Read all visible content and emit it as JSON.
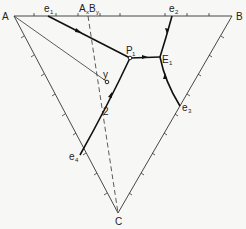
{
  "diagram": {
    "type": "ternary-phase-diagram",
    "vertices": {
      "A": {
        "label": "A",
        "x": 14,
        "y": 16
      },
      "B": {
        "label": "B",
        "x": 232,
        "y": 16
      },
      "C": {
        "label": "C",
        "x": 118,
        "y": 213
      }
    },
    "points": {
      "e1": {
        "label": "e",
        "sub": "1",
        "x": 48,
        "y": 16
      },
      "AxBy": {
        "label": "A",
        "sub1": "x",
        "mid": "B",
        "sub2": "y",
        "x": 88,
        "y": 16
      },
      "e2": {
        "label": "e",
        "sub": "2",
        "x": 172,
        "y": 16
      },
      "P1": {
        "label": "P",
        "sub": "1",
        "x": 130,
        "y": 58
      },
      "E1": {
        "label": "E",
        "sub": "1",
        "x": 160,
        "y": 57
      },
      "e3": {
        "label": "e",
        "sub": "3",
        "x": 180,
        "y": 106
      },
      "e4": {
        "label": "e",
        "sub": "4",
        "x": 80,
        "y": 155
      },
      "y": {
        "label": "y",
        "x": 107,
        "y": 82
      },
      "p2": {
        "label": "2",
        "x": 101,
        "y": 111
      }
    },
    "curves": [
      {
        "name": "e1-P1",
        "from": "e1",
        "to": "P1",
        "arrow": "toward P1",
        "style": "bold"
      },
      {
        "name": "P1-E1",
        "from": "P1",
        "to": "E1",
        "arrow": "toward E1",
        "style": "bold"
      },
      {
        "name": "e2-E1",
        "from": "e2",
        "to": "E1",
        "arrow": "toward E1",
        "style": "bold"
      },
      {
        "name": "e3-E1",
        "from": "e3",
        "to": "E1",
        "arrow": "toward E1",
        "style": "bold"
      },
      {
        "name": "e4-P1",
        "from": "e4",
        "to": "P1",
        "arrow": "toward P1",
        "style": "bold"
      },
      {
        "name": "A-y",
        "from": "A",
        "to": "y",
        "style": "thin"
      },
      {
        "name": "AxBy-C",
        "from": "AxBy",
        "to": "C",
        "style": "dashed"
      }
    ],
    "colors": {
      "line": "#222222",
      "background": "#f7f7f5"
    }
  }
}
